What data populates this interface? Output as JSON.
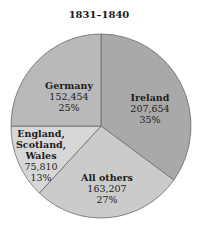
{
  "chart_data": {
    "type": "pie",
    "title": "1831–1840",
    "slices": [
      {
        "label": "Ireland",
        "value": 207654,
        "value_label": "207,654",
        "percent": 35,
        "percent_label": "35%",
        "color": "#a9a9a9"
      },
      {
        "label": "All others",
        "value": 163207,
        "value_label": "163,207",
        "percent": 27,
        "percent_label": "27%",
        "color": "#cbcbcb"
      },
      {
        "label": "England, Scotland, Wales",
        "label_lines": [
          "England,",
          "Scotland,",
          "Wales"
        ],
        "value": 75810,
        "value_label": "75,810",
        "percent": 13,
        "percent_label": "13%",
        "color": "#d7d7d7"
      },
      {
        "label": "Germany",
        "value": 152454,
        "value_label": "152,454",
        "percent": 25,
        "percent_label": "25%",
        "color": "#b9b9b9"
      }
    ],
    "start_angle_deg": 0,
    "direction": "clockwise",
    "legend": "none"
  }
}
